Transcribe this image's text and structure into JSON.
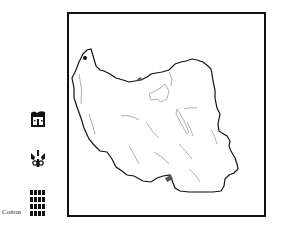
{
  "legend": {
    "items": [
      {
        "icon": "house-icon",
        "label": ""
      },
      {
        "icon": "face-icon",
        "label": ""
      },
      {
        "icon": "grid-icon",
        "label": "Cotton"
      }
    ]
  },
  "map": {
    "region": "Iran outline map",
    "border_color": "#111111",
    "river_color": "#9a9a9a"
  }
}
